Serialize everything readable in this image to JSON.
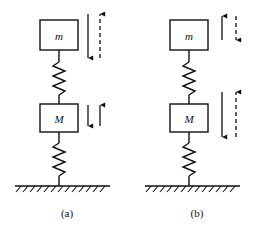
{
  "figure": {
    "type": "physics-diagram",
    "stroke_color": "#111111",
    "background_color": "#ffffff"
  },
  "panels": [
    {
      "id": "a",
      "caption": "(a)",
      "blocks": [
        {
          "id": "upper",
          "label": "m"
        },
        {
          "id": "lower",
          "label": "M"
        }
      ],
      "springs": [
        {
          "id": "upper-spring",
          "coils": 6
        },
        {
          "id": "lower-spring",
          "coils": 6
        }
      ],
      "ground": {
        "hatch_marks": 13
      },
      "arrows": [
        {
          "id": "a-m-solid",
          "mass": "m",
          "side": "left",
          "direction": "down",
          "style": "solid",
          "length": "long"
        },
        {
          "id": "a-m-dashed",
          "mass": "m",
          "side": "right",
          "direction": "up",
          "style": "dashed",
          "length": "long"
        },
        {
          "id": "a-M-solid",
          "mass": "M",
          "side": "left",
          "direction": "down",
          "style": "solid",
          "length": "short"
        },
        {
          "id": "a-M-solid2",
          "mass": "M",
          "side": "right",
          "direction": "up",
          "style": "solid",
          "length": "short"
        }
      ]
    },
    {
      "id": "b",
      "caption": "(b)",
      "blocks": [
        {
          "id": "upper",
          "label": "m"
        },
        {
          "id": "lower",
          "label": "M"
        }
      ],
      "springs": [
        {
          "id": "upper-spring",
          "coils": 6
        },
        {
          "id": "lower-spring",
          "coils": 6
        }
      ],
      "ground": {
        "hatch_marks": 13
      },
      "arrows": [
        {
          "id": "b-m-solid",
          "mass": "m",
          "side": "left",
          "direction": "up",
          "style": "solid",
          "length": "short"
        },
        {
          "id": "b-m-dashed",
          "mass": "m",
          "side": "right",
          "direction": "down",
          "style": "dashed",
          "length": "short"
        },
        {
          "id": "b-M-solid",
          "mass": "M",
          "side": "left",
          "direction": "down",
          "style": "solid",
          "length": "long"
        },
        {
          "id": "b-M-dashed",
          "mass": "M",
          "side": "right",
          "direction": "up",
          "style": "dashed",
          "length": "long"
        }
      ]
    }
  ]
}
